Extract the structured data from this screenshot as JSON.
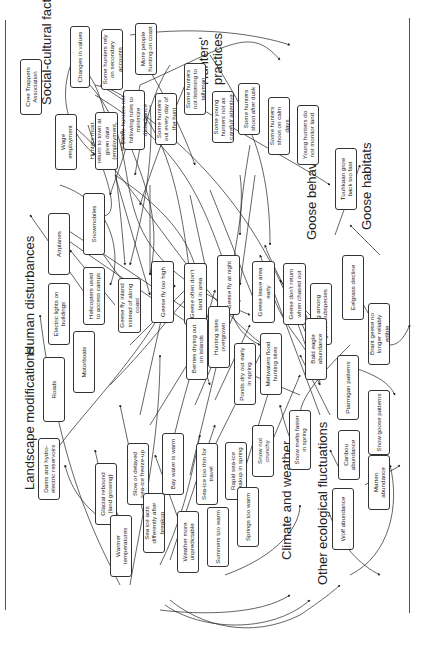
{
  "diagram": {
    "orientation": "rotated 90deg counter-clockwise",
    "groups": [
      {
        "id": "social",
        "label": "Social-cultural factors"
      },
      {
        "id": "hunters",
        "label": "Hunters' practices"
      },
      {
        "id": "human",
        "label": "Human disturbances"
      },
      {
        "id": "landscape",
        "label": "Landscape modifications"
      },
      {
        "id": "goosebeh",
        "label": "Goose behaviour"
      },
      {
        "id": "goosehab",
        "label": "Goose habitats"
      },
      {
        "id": "climate",
        "label": "Climate and weather"
      },
      {
        "id": "ecological",
        "label": "Other ecological fluctuations"
      }
    ],
    "nodes": [
      {
        "id": "cree",
        "label": "Cree Trappers Association"
      },
      {
        "id": "values",
        "label": "Changes in values"
      },
      {
        "id": "wage",
        "label": "Wage employment"
      },
      {
        "id": "return",
        "label": "Hunters must return to town at given date (employment, school)"
      },
      {
        "id": "secondary",
        "label": "Some hunters rely on secondary accounts"
      },
      {
        "id": "coast",
        "label": "More people hunting on coast"
      },
      {
        "id": "rules",
        "label": "Some hunters not following rules to minimize disturbance"
      },
      {
        "id": "everyday",
        "label": "Some hunters out every day of the hunt"
      },
      {
        "id": "tallyman",
        "label": "Some hunters not listening to tallyman"
      },
      {
        "id": "young",
        "label": "Some young hunters not as careful/ attentive"
      },
      {
        "id": "dusk",
        "label": "Some hunters shoot after dusk"
      },
      {
        "id": "calm",
        "label": "Some hunters shoot on calm days"
      },
      {
        "id": "monitor",
        "label": "Young hunters do not monitor land"
      },
      {
        "id": "airplanes",
        "label": "Airplanes"
      },
      {
        "id": "snowmobiles",
        "label": "Snowmobiles"
      },
      {
        "id": "helicopters",
        "label": "Helicopters used to access camps"
      },
      {
        "id": "lights",
        "label": "Electric lights on buildings"
      },
      {
        "id": "motorboats",
        "label": "Motorboats"
      },
      {
        "id": "roads",
        "label": "Roads"
      },
      {
        "id": "dams",
        "label": "Dams and hydro-electric reservoirs"
      },
      {
        "id": "glacial",
        "label": "Glacial rebound (land growing)"
      },
      {
        "id": "inland",
        "label": "Geese fly inland instead of along coast"
      },
      {
        "id": "flyhigh",
        "label": "Geese fly too high"
      },
      {
        "id": "dontland",
        "label": "Geese often don't land in area"
      },
      {
        "id": "night",
        "label": "Geese fly at night"
      },
      {
        "id": "leave",
        "label": "Geese leave area early"
      },
      {
        "id": "dontreturn",
        "label": "Geese don't return when chased out"
      },
      {
        "id": "mixing",
        "label": "Mixing among geese subspecies"
      },
      {
        "id": "tuuhkaan",
        "label": "Tuuhkaan grow back too fast"
      },
      {
        "id": "eelgrass",
        "label": "Eelgrass decline"
      },
      {
        "id": "brant",
        "label": "Brant geese no longer reliably edible"
      },
      {
        "id": "berries",
        "label": "Berries drying out on islands"
      },
      {
        "id": "overgrown",
        "label": "Hunting sites overgrown"
      },
      {
        "id": "ponds",
        "label": "Ponds dry out early in spring"
      },
      {
        "id": "meltwater",
        "label": "Meltwaters flood hunting sites"
      },
      {
        "id": "baldeagle",
        "label": "Bald eagle abundance"
      },
      {
        "id": "ptarmigan",
        "label": "Ptarmigan patterns"
      },
      {
        "id": "snowgoose",
        "label": "Snow goose patterns"
      },
      {
        "id": "caribou",
        "label": "Caribou abundance"
      },
      {
        "id": "marten",
        "label": "Marten abundance"
      },
      {
        "id": "wolf",
        "label": "Wolf abundance"
      },
      {
        "id": "seaiceslow",
        "label": "Slow or delayed sea-ice freeze-up"
      },
      {
        "id": "baywarm",
        "label": "Bay water is warm"
      },
      {
        "id": "seaicethin",
        "label": "Sea-ice too thin for travel"
      },
      {
        "id": "seaicerapid",
        "label": "Rapid sea-ice breakup in spring"
      },
      {
        "id": "snowcrunchy",
        "label": "Snow not crunchy"
      },
      {
        "id": "snowmelts",
        "label": "Snow melts faster in spring"
      },
      {
        "id": "seaiceacts",
        "label": "Sea ice acts differently after breakup"
      },
      {
        "id": "warmer",
        "label": "Warmer temperatures"
      },
      {
        "id": "weather",
        "label": "Weather more unpredictable"
      },
      {
        "id": "summers",
        "label": "Summers too warm"
      },
      {
        "id": "springs",
        "label": "Springs too warm"
      }
    ]
  }
}
